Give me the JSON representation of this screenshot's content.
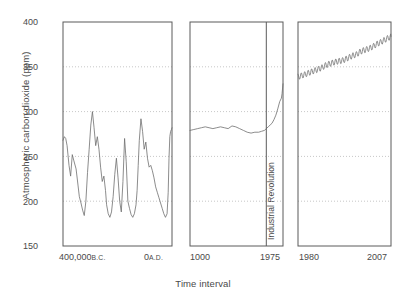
{
  "chart_data": {
    "type": "line",
    "title": "",
    "subtitle": "",
    "xlabel": "Time interval",
    "ylabel": "Atmospheric carbon dioxide (ppm)",
    "ylim": [
      150,
      400
    ],
    "yticks": [
      150,
      200,
      250,
      300,
      350,
      400
    ],
    "ytick_labels": [
      "150",
      "200",
      "250",
      "300",
      "350",
      "400"
    ],
    "grid": "horizontal dotted gridlines at 200, 250, 300, 350",
    "legend": "none",
    "broken_axis": true,
    "panels": [
      {
        "name": "ice-core-record",
        "xlim": [
          -400000,
          0
        ],
        "xtick_labels": [
          "400,000 B.C.",
          "0 A.D."
        ],
        "xtick_main": [
          "400,000",
          "0"
        ],
        "xtick_era": [
          "B.C.",
          "A.D."
        ],
        "series_name": "Ice core CO2",
        "x": [
          -400000,
          -395000,
          -390000,
          -385000,
          -378000,
          -372000,
          -366000,
          -360000,
          -352000,
          -345000,
          -340000,
          -334000,
          -328000,
          -322000,
          -316000,
          -310000,
          -304000,
          -298000,
          -292000,
          -286000,
          -280000,
          -274000,
          -268000,
          -262000,
          -256000,
          -250000,
          -244000,
          -240000,
          -234000,
          -228000,
          -222000,
          -216000,
          -210000,
          -204000,
          -198000,
          -192000,
          -186000,
          -180000,
          -174000,
          -168000,
          -162000,
          -156000,
          -150000,
          -144000,
          -138000,
          -132000,
          -128000,
          -124000,
          -120000,
          -114000,
          -108000,
          -102000,
          -96000,
          -90000,
          -84000,
          -78000,
          -72000,
          -66000,
          -60000,
          -54000,
          -48000,
          -42000,
          -36000,
          -30000,
          -24000,
          -18000,
          -14000,
          -11000,
          -8000,
          -5000,
          -2000,
          0
        ],
        "values": [
          268,
          272,
          270,
          262,
          240,
          228,
          252,
          245,
          236,
          218,
          205,
          198,
          190,
          184,
          200,
          232,
          258,
          285,
          300,
          282,
          262,
          272,
          258,
          238,
          222,
          228,
          212,
          196,
          186,
          182,
          188,
          205,
          230,
          248,
          226,
          200,
          188,
          222,
          270,
          244,
          200,
          192,
          185,
          182,
          186,
          196,
          212,
          240,
          268,
          292,
          278,
          258,
          266,
          248,
          238,
          240,
          234,
          226,
          216,
          210,
          204,
          198,
          192,
          186,
          182,
          186,
          210,
          248,
          272,
          278,
          280,
          282
        ]
      },
      {
        "name": "millennium-record",
        "xlim": [
          1000,
          1975
        ],
        "xtick_labels": [
          "1000",
          "1975"
        ],
        "annotation": "Industrial Revolution",
        "annotation_x": 1800,
        "series_name": "Ice core / historic CO2",
        "x": [
          1000,
          1040,
          1080,
          1120,
          1160,
          1200,
          1240,
          1280,
          1320,
          1360,
          1400,
          1440,
          1480,
          1520,
          1560,
          1600,
          1640,
          1680,
          1720,
          1750,
          1780,
          1800,
          1820,
          1840,
          1860,
          1880,
          1900,
          1920,
          1940,
          1958,
          1965,
          1975
        ],
        "values": [
          279,
          280,
          281,
          282,
          283,
          282,
          281,
          282,
          283,
          282,
          281,
          284,
          283,
          281,
          279,
          277,
          276,
          277,
          277,
          278,
          279,
          281,
          283,
          285,
          287,
          291,
          296,
          303,
          311,
          315,
          320,
          331
        ]
      },
      {
        "name": "modern-record",
        "xlim": [
          1980,
          2007
        ],
        "xtick_labels": [
          "1980",
          "2007"
        ],
        "series_name": "Mauna Loa CO2 (Keeling curve)",
        "description": "monthly sawtooth with seasonal oscillation of about 6 ppm superimposed on rising trend",
        "x": [
          1980,
          1981,
          1982,
          1983,
          1984,
          1985,
          1986,
          1987,
          1988,
          1989,
          1990,
          1991,
          1992,
          1993,
          1994,
          1995,
          1996,
          1997,
          1998,
          1999,
          2000,
          2001,
          2002,
          2003,
          2004,
          2005,
          2006,
          2007
        ],
        "values": [
          338.7,
          340.1,
          341.4,
          343.0,
          344.6,
          346.0,
          347.4,
          349.2,
          351.6,
          353.1,
          354.4,
          355.6,
          356.4,
          357.1,
          358.8,
          360.8,
          362.6,
          363.8,
          366.6,
          368.3,
          369.5,
          371.0,
          373.1,
          375.6,
          377.4,
          379.6,
          381.8,
          383.8
        ],
        "seasonal_amplitude": 3.2
      }
    ]
  }
}
